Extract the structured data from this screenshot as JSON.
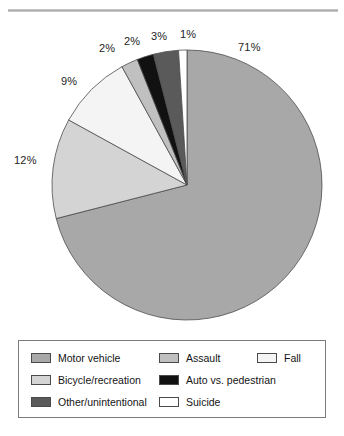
{
  "chart_data": {
    "type": "pie",
    "title": "",
    "subtitle": "",
    "xlabel": "",
    "ylabel": "",
    "legend_position": "bottom",
    "grid": false,
    "categories": [
      "Motor vehicle",
      "Bicycle/recreation",
      "Fall",
      "Assault",
      "Other/unintentional",
      "Auto vs. pedestrian",
      "Suicide"
    ],
    "values": [
      71,
      12,
      9,
      2,
      3,
      2,
      1
    ],
    "data_labels": [
      "71%",
      "12%",
      "9%",
      "2%",
      "3%",
      "2%",
      "1%"
    ],
    "colors": [
      "#a8a8a8",
      "#d4d4d4",
      "#f4f4f4",
      "#c0c0c0",
      "#5a5a5a",
      "#111111",
      "#ffffff"
    ],
    "slice_order_clockwise": [
      "Motor vehicle",
      "Bicycle/recreation",
      "Fall",
      "Assault",
      "Auto vs. pedestrian",
      "Other/unintentional",
      "Suicide"
    ]
  },
  "pie": {
    "labels": [
      {
        "text": "71%",
        "x": 238,
        "y": 41
      },
      {
        "text": "12%",
        "x": 14,
        "y": 154
      },
      {
        "text": "9%",
        "x": 61,
        "y": 75
      },
      {
        "text": "2%",
        "x": 99,
        "y": 42
      },
      {
        "text": "2%",
        "x": 124,
        "y": 35
      },
      {
        "text": "3%",
        "x": 151,
        "y": 30
      },
      {
        "text": "1%",
        "x": 180,
        "y": 28
      }
    ]
  },
  "legend": {
    "items": [
      {
        "label": "Motor vehicle",
        "color": "#a8a8a8",
        "col": 0,
        "row": 0
      },
      {
        "label": "Bicycle/recreation",
        "color": "#d4d4d4",
        "col": 0,
        "row": 1
      },
      {
        "label": "Other/unintentional",
        "color": "#5a5a5a",
        "col": 0,
        "row": 2
      },
      {
        "label": "Assault",
        "color": "#c0c0c0",
        "col": 1,
        "row": 0
      },
      {
        "label": "Auto vs. pedestrian",
        "color": "#111111",
        "col": 1,
        "row": 1
      },
      {
        "label": "Suicide",
        "color": "#ffffff",
        "col": 1,
        "row": 2
      },
      {
        "label": "Fall",
        "color": "#f4f4f4",
        "col": 2,
        "row": 0
      }
    ]
  }
}
